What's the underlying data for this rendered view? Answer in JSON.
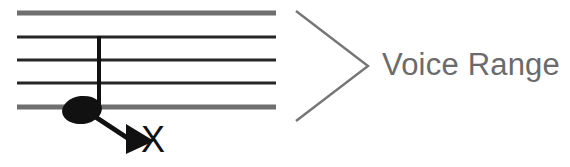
{
  "figure": {
    "type": "music-staff-diagram",
    "background_color": "#ffffff"
  },
  "staff": {
    "name": "five-line-staff",
    "line_count": 5,
    "x_start": 17,
    "x_end": 276,
    "line_y": [
      13,
      37,
      60,
      83,
      107
    ],
    "line_spacing": 23.5,
    "inner_line_color": "#262626",
    "outer_line_color": "#6f6f6f",
    "inner_line_width": 2.6,
    "outer_line_width": 5.0
  },
  "note": {
    "name": "whole-note-with-stem",
    "head_center_x": 82,
    "head_center_y": 110,
    "head_rx": 20,
    "head_ry": 14,
    "head_rotation_deg": -7,
    "head_color": "#111111",
    "stem_x": 99,
    "stem_top_y": 36,
    "stem_bottom_y": 110,
    "stem_color": "#111111",
    "stem_width": 4
  },
  "pointer": {
    "name": "note-pointer-arrow",
    "line_from_x": 95,
    "line_from_y": 117,
    "line_to_x": 130,
    "line_to_y": 140,
    "color": "#111111",
    "line_width": 5,
    "arrowhead_points": "126,125 152,141 126,153"
  },
  "labels": {
    "note_name": "X",
    "range_text": "Voice Range",
    "range_text_color": "#6b6b6b",
    "note_name_color": "#111111"
  },
  "chevron": {
    "name": "range-chevron-bracket",
    "points": "296,11 368,66 296,121",
    "color": "#767676",
    "stroke_width": 2.4
  }
}
